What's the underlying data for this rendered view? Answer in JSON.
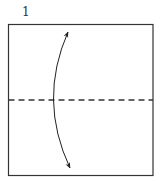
{
  "diagram": {
    "step_number": "1",
    "type": "origami fold instruction",
    "paper": {
      "shape": "square",
      "edge_color": "#333333",
      "fill": "#ffffff"
    },
    "fold_line": {
      "style": "valley-fold (dashed)",
      "orientation": "horizontal",
      "position": "middle"
    },
    "arrow": {
      "type": "double-headed curved arrow",
      "meaning": "fold bottom to top and unfold"
    }
  }
}
